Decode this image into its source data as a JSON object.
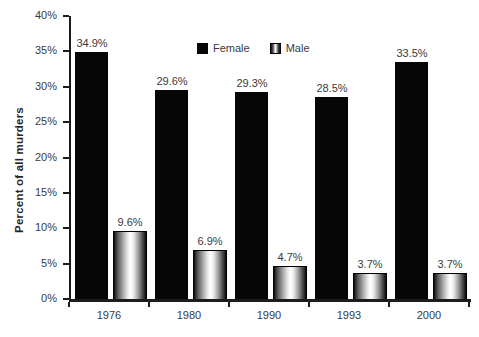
{
  "chart_data": {
    "type": "bar",
    "title": "",
    "xlabel": "",
    "ylabel": "Percent of all murders",
    "categories": [
      "1976",
      "1980",
      "1990",
      "1993",
      "2000"
    ],
    "series": [
      {
        "name": "Female",
        "values": [
          34.9,
          29.6,
          29.3,
          28.5,
          33.5
        ],
        "style": "solid-black"
      },
      {
        "name": "Male",
        "values": [
          9.6,
          6.9,
          4.7,
          3.7,
          3.7
        ],
        "style": "metallic-gradient"
      }
    ],
    "bar_value_labels": [
      "34.9%",
      "29.6%",
      "29.3%",
      "28.5%",
      "33.5%",
      "9.6%",
      "6.9%",
      "4.7%",
      "3.7%",
      "3.7%"
    ],
    "ylim": [
      0,
      40
    ],
    "ytick_step": 5,
    "ytick_labels": [
      "0%",
      "5%",
      "10%",
      "15%",
      "20%",
      "25%",
      "30%",
      "35%",
      "40%"
    ],
    "grid": false,
    "legend_position": "top-center"
  },
  "colors": {
    "background": "#ffffff",
    "female_bar": "#060606",
    "male_bar_edge": "#0c0c0c",
    "male_bar_center": "#ffffff",
    "axis": "#1c1c1c",
    "text": "#3a3a3a"
  }
}
